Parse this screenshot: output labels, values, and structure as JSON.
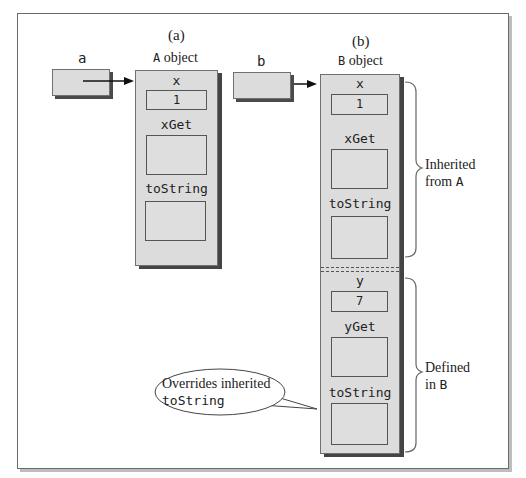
{
  "panels": {
    "a": {
      "caption": "(a)",
      "var_label": "a",
      "object_class": "A",
      "object_word": "object",
      "fields": [
        {
          "name": "x",
          "value": "1"
        }
      ],
      "methods": [
        {
          "name": "xGet"
        },
        {
          "name": "toString"
        }
      ]
    },
    "b": {
      "caption": "(b)",
      "var_label": "b",
      "object_class": "B",
      "object_word": "object",
      "inherited": {
        "fields": [
          {
            "name": "x",
            "value": "1"
          }
        ],
        "methods": [
          {
            "name": "xGet"
          },
          {
            "name": "toString"
          }
        ]
      },
      "defined": {
        "fields": [
          {
            "name": "y",
            "value": "7"
          }
        ],
        "methods": [
          {
            "name": "yGet"
          },
          {
            "name": "toString"
          }
        ]
      }
    }
  },
  "annotations": {
    "inherited": {
      "line1": "Inherited",
      "line2_text": "from",
      "line2_code": "A"
    },
    "defined": {
      "line1": "Defined",
      "line2_text": "in",
      "line2_code": "B"
    },
    "callout": {
      "line1": "Overrides inherited",
      "line2_code": "toString"
    }
  },
  "colors": {
    "object_fill": "#dcdcdc",
    "shadow": "#444444",
    "frame": "#6a6a6a",
    "text": "#222222"
  }
}
